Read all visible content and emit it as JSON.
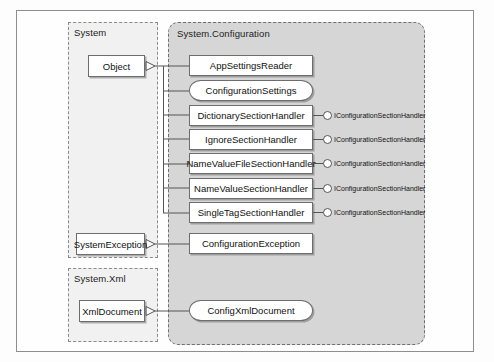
{
  "diagram": {
    "packages": [
      {
        "id": "system",
        "label": "System"
      },
      {
        "id": "system_xml",
        "label": "System.Xml"
      },
      {
        "id": "system_configuration",
        "label": "System.Configuration"
      }
    ],
    "base_classes": [
      {
        "id": "object",
        "label": "Object"
      },
      {
        "id": "system_exception",
        "label": "SystemException"
      },
      {
        "id": "xml_document",
        "label": "XmlDocument"
      }
    ],
    "config_classes": [
      {
        "id": "app_settings_reader",
        "label": "AppSettingsReader",
        "shape": "rect"
      },
      {
        "id": "configuration_settings",
        "label": "ConfigurationSettings",
        "shape": "rounded"
      },
      {
        "id": "dictionary_section_handler",
        "label": "DictionarySectionHandler",
        "shape": "rect"
      },
      {
        "id": "ignore_section_handler",
        "label": "IgnoreSectionHandler",
        "shape": "rect"
      },
      {
        "id": "name_value_file_section_handler",
        "label": "NameValueFileSectionHandler",
        "shape": "rect"
      },
      {
        "id": "name_value_section_handler",
        "label": "NameValueSectionHandler",
        "shape": "rect"
      },
      {
        "id": "single_tag_section_handler",
        "label": "SingleTagSectionHandler",
        "shape": "rect"
      },
      {
        "id": "configuration_exception",
        "label": "ConfigurationException",
        "shape": "rect"
      },
      {
        "id": "config_xml_document",
        "label": "ConfigXmlDocument",
        "shape": "rounded"
      }
    ],
    "interfaces": [
      {
        "id": "iface_1",
        "label": "IConfigurationSectionHandler",
        "implemented_by": "DictionarySectionHandler"
      },
      {
        "id": "iface_2",
        "label": "IConfigurationSectionHandler",
        "implemented_by": "IgnoreSectionHandler"
      },
      {
        "id": "iface_3",
        "label": "IConfigurationSectionHandler",
        "implemented_by": "NameValueFileSectionHandler"
      },
      {
        "id": "iface_4",
        "label": "IConfigurationSectionHandler",
        "implemented_by": "NameValueSectionHandler"
      },
      {
        "id": "iface_5",
        "label": "IConfigurationSectionHandler",
        "implemented_by": "SingleTagSectionHandler"
      }
    ],
    "inheritance": [
      {
        "from": "AppSettingsReader",
        "to": "Object"
      },
      {
        "from": "ConfigurationSettings",
        "to": "Object"
      },
      {
        "from": "DictionarySectionHandler",
        "to": "Object"
      },
      {
        "from": "IgnoreSectionHandler",
        "to": "Object"
      },
      {
        "from": "NameValueFileSectionHandler",
        "to": "Object"
      },
      {
        "from": "NameValueSectionHandler",
        "to": "Object"
      },
      {
        "from": "SingleTagSectionHandler",
        "to": "Object"
      },
      {
        "from": "ConfigurationException",
        "to": "SystemException"
      },
      {
        "from": "ConfigXmlDocument",
        "to": "XmlDocument"
      }
    ],
    "colors": {
      "page_background": "#fdfdfd",
      "frame_border": "#8e8e8e",
      "package_plain_fill": "#f1f1f1",
      "package_plain_border": "#8a8a8a",
      "package_config_fill": "#d6d6d6",
      "package_config_border": "#6f6f6f",
      "node_fill": "#ffffff",
      "node_border": "#6d6d6d",
      "connector": "#555555",
      "text": "#111111"
    }
  }
}
